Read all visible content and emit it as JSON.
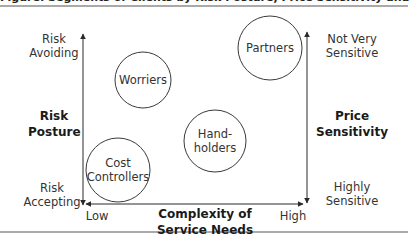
{
  "figure": {
    "title_partial": "Figure: Segments of Clients by Risk Posture, Price Sensitivity and Complexity of Service Needs"
  },
  "axes": {
    "left": {
      "name": "Risk Posture",
      "top_label": "Risk Avoiding",
      "bottom_label": "Risk Accepting"
    },
    "right": {
      "name": "Price Sensitivity",
      "top_label": "Not Very Sensitive",
      "bottom_label": "Highly Sensitive"
    },
    "bottom": {
      "name": "Complexity of Service Needs",
      "low_label": "Low",
      "high_label": "High"
    }
  },
  "labels": {
    "left_top_1": "Risk",
    "left_top_2": "Avoiding",
    "left_name_1": "Risk",
    "left_name_2": "Posture",
    "left_bottom_1": "Risk",
    "left_bottom_2": "Accepting",
    "right_top_1": "Not Very",
    "right_top_2": "Sensitive",
    "right_name_1": "Price",
    "right_name_2": "Sensitivity",
    "right_bottom_1": "Highly",
    "right_bottom_2": "Sensitive",
    "bottom_name_1": "Complexity of",
    "bottom_name_2": "Service Needs",
    "low": "Low",
    "high": "High"
  },
  "segments": [
    {
      "name": "Worriers",
      "display": "Worriers",
      "cx": 143,
      "cy": 80,
      "r": 28
    },
    {
      "name": "Partners",
      "display": "Partners",
      "cx": 270,
      "cy": 48,
      "r": 32
    },
    {
      "name": "Hand-holders",
      "display": "Hand-\nholders",
      "cx": 215,
      "cy": 141,
      "r": 31
    },
    {
      "name": "Cost Controllers",
      "display": "Cost\nControllers",
      "cx": 118,
      "cy": 170,
      "r": 32
    }
  ],
  "colors": {
    "line": "#3a3a3a",
    "rule": "#555555",
    "text": "#333333"
  }
}
